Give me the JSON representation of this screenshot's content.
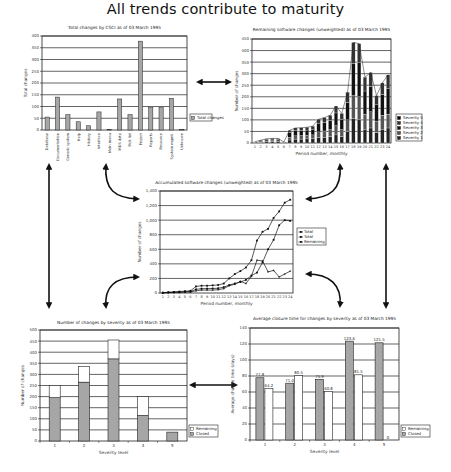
{
  "page": {
    "title": "All trends contribute to maturity"
  },
  "chart_data": [
    {
      "id": "csci",
      "type": "bar",
      "title": "Total changes by CSCI as of 03 March 1995",
      "xlabel": "",
      "ylabel": "Total changes",
      "ylim": [
        0,
        400
      ],
      "yticks": [
        0,
        50,
        100,
        150,
        200,
        250,
        300,
        350,
        400
      ],
      "grid": true,
      "legend_position": "right",
      "categories": [
        "Database",
        "Documentation",
        "Generic system",
        "Help",
        "History",
        "Interface",
        "Main menu",
        "MDS data",
        "Pick list",
        "Project",
        "Reports",
        "Resource",
        "System mgmt.",
        "Unknown"
      ],
      "series": [
        {
          "name": "Total changes",
          "values": [
            55,
            140,
            65,
            35,
            18,
            77,
            3,
            132,
            65,
            378,
            95,
            95,
            135,
            2
          ]
        }
      ]
    },
    {
      "id": "remaining",
      "type": "bar",
      "stacked": true,
      "title": "Remaining software changes (unweighted) as of 03 March 1995",
      "xlabel": "Period number, monthly",
      "ylabel": "Number of changes",
      "ylim": [
        0,
        450
      ],
      "yticks": [
        0,
        50,
        100,
        150,
        200,
        250,
        300,
        350,
        400,
        450
      ],
      "grid": true,
      "legend_position": "right",
      "categories": [
        "1",
        "2",
        "3",
        "4",
        "5",
        "6",
        "7",
        "8",
        "9",
        "10",
        "11",
        "12",
        "13",
        "14",
        "15",
        "16",
        "17",
        "18",
        "19",
        "20",
        "21",
        "22",
        "23",
        "24"
      ],
      "series": [
        {
          "name": "Severity 5",
          "values": [
            0,
            0,
            0,
            0,
            0,
            0,
            0,
            0,
            0,
            0,
            0,
            0,
            0,
            0,
            0,
            0,
            0,
            0,
            0,
            0,
            0,
            0,
            0,
            0
          ]
        },
        {
          "name": "Severity 4",
          "values": [
            1,
            2,
            3,
            3,
            3,
            1,
            10,
            12,
            12,
            12,
            13,
            20,
            20,
            22,
            30,
            25,
            45,
            90,
            80,
            60,
            60,
            40,
            50,
            60
          ]
        },
        {
          "name": "Severity 3",
          "values": [
            2,
            4,
            6,
            7,
            7,
            2,
            20,
            22,
            22,
            23,
            25,
            35,
            38,
            40,
            55,
            45,
            75,
            140,
            150,
            100,
            110,
            70,
            90,
            110
          ]
        },
        {
          "name": "Severity 2",
          "values": [
            1,
            3,
            4,
            4,
            4,
            1,
            12,
            14,
            15,
            15,
            16,
            25,
            27,
            30,
            40,
            30,
            50,
            100,
            100,
            65,
            70,
            50,
            60,
            60
          ]
        },
        {
          "name": "Severity 1",
          "values": [
            1,
            3,
            5,
            6,
            5,
            1,
            13,
            17,
            17,
            18,
            19,
            23,
            25,
            28,
            35,
            28,
            50,
            105,
            100,
            60,
            65,
            45,
            60,
            65
          ]
        }
      ],
      "totals": [
        5,
        12,
        18,
        20,
        19,
        5,
        55,
        65,
        66,
        68,
        73,
        103,
        110,
        120,
        160,
        128,
        220,
        435,
        430,
        285,
        305,
        205,
        260,
        295
      ]
    },
    {
      "id": "accumulated",
      "type": "line",
      "title": "Accumulated software changes (unweighted) as of 03 March 1995",
      "xlabel": "Period number, monthly",
      "ylabel": "Number of changes",
      "ylim": [
        0,
        1400
      ],
      "yticks": [
        0,
        200,
        400,
        600,
        800,
        1000,
        1200,
        1400
      ],
      "ytick_labels": [
        "0",
        "200",
        "400",
        "600",
        "800",
        "1,000",
        "1,200",
        "1,400"
      ],
      "grid": true,
      "legend_position": "right",
      "x": [
        1,
        2,
        3,
        4,
        5,
        6,
        7,
        8,
        9,
        10,
        11,
        12,
        13,
        14,
        15,
        16,
        17,
        18,
        19,
        20,
        21,
        22,
        23,
        24
      ],
      "series": [
        {
          "name": "Total",
          "values": [
            5,
            10,
            15,
            20,
            25,
            30,
            90,
            100,
            100,
            105,
            110,
            130,
            200,
            260,
            300,
            350,
            450,
            720,
            840,
            880,
            1030,
            1120,
            1240,
            1280
          ]
        },
        {
          "name": "Total",
          "values": [
            0,
            5,
            8,
            10,
            15,
            20,
            50,
            60,
            60,
            62,
            65,
            80,
            110,
            130,
            150,
            180,
            240,
            280,
            420,
            600,
            730,
            930,
            1000,
            990
          ]
        },
        {
          "name": "Remaining",
          "values": [
            5,
            8,
            10,
            12,
            15,
            15,
            30,
            40,
            40,
            40,
            45,
            60,
            100,
            120,
            160,
            130,
            230,
            450,
            440,
            290,
            310,
            220,
            260,
            300
          ]
        }
      ]
    },
    {
      "id": "severity_counts",
      "type": "bar",
      "stacked": true,
      "title": "Number of changes by severity as of 03 March 1995",
      "xlabel": "Severity level",
      "ylabel": "Number of changes",
      "ylim": [
        0,
        500
      ],
      "yticks": [
        0,
        50,
        100,
        150,
        200,
        250,
        300,
        350,
        400,
        450,
        500
      ],
      "grid": true,
      "legend_position": "right",
      "categories": [
        "1",
        "2",
        "3",
        "4",
        "5"
      ],
      "series": [
        {
          "name": "Remaining",
          "values": [
            55,
            70,
            85,
            85,
            0
          ]
        },
        {
          "name": "Closed",
          "values": [
            195,
            265,
            370,
            115,
            40
          ]
        }
      ]
    },
    {
      "id": "closure_time",
      "type": "bar",
      "title": "Average closure time for changes by severity as of 03 March 1995",
      "xlabel": "Severity level",
      "ylabel": "Average change time (days)",
      "ylim": [
        0,
        140
      ],
      "yticks": [
        0,
        20,
        40,
        60,
        80,
        100,
        120,
        140
      ],
      "grid": true,
      "legend_position": "right",
      "categories": [
        "1",
        "2",
        "3",
        "4",
        "5"
      ],
      "series": [
        {
          "name": "Closed",
          "values": [
            77.8,
            71.0,
            75.9,
            123.6,
            121.5
          ]
        },
        {
          "name": "Remaining",
          "values": [
            64.2,
            80.5,
            60.8,
            81.5,
            0
          ]
        }
      ],
      "data_labels": {
        "Closed": [
          "77.8",
          "71.0",
          "75.9",
          "123.6",
          "121.5"
        ],
        "Remaining": [
          "64.2",
          "80.5",
          "60.8",
          "81.5",
          "0"
        ]
      }
    }
  ],
  "colors": {
    "bar_gray": "#a6a6a6",
    "bar_dark": "#1a1a1a",
    "bar_white": "#ffffff",
    "grid": "#222222",
    "arrow": "#111111"
  }
}
